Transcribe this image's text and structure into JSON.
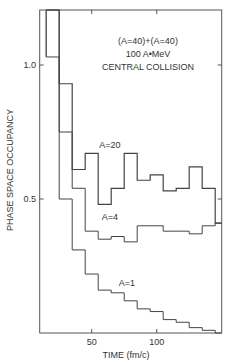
{
  "chart_data": {
    "type": "line",
    "style": "step histogram",
    "title_lines": [
      "(A=40)+(A=40)",
      "100 A•MeV",
      "CENTRAL COLLISION"
    ],
    "xlabel": "TIME (fm/c)",
    "ylabel": "PHASE SPACE OCCUPANCY",
    "xlim": [
      10,
      150
    ],
    "ylim": [
      0,
      1.2
    ],
    "x_ticks": [
      50,
      100
    ],
    "y_ticks": [
      {
        "value": 0.5,
        "label": "0.5"
      },
      {
        "value": 1.0,
        "label": "1.0"
      }
    ],
    "grid": false,
    "x_bin_centers": [
      20,
      30,
      40,
      50,
      60,
      70,
      80,
      90,
      100,
      110,
      120,
      130,
      140,
      150
    ],
    "series": [
      {
        "name": "A=20",
        "label": "A=20",
        "values": [
          1.3,
          0.93,
          0.61,
          0.67,
          0.48,
          0.54,
          0.67,
          0.57,
          0.59,
          0.53,
          0.54,
          0.62,
          0.54,
          0.41
        ]
      },
      {
        "name": "A=4",
        "label": "A=4",
        "values": [
          1.3,
          0.75,
          0.54,
          0.38,
          0.35,
          0.36,
          0.34,
          0.4,
          0.4,
          0.38,
          0.38,
          0.37,
          0.4,
          0.41
        ]
      },
      {
        "name": "A=1",
        "label": "A=1",
        "values": [
          1.03,
          0.5,
          0.31,
          0.22,
          0.16,
          0.15,
          0.12,
          0.09,
          0.08,
          0.05,
          0.04,
          0.02,
          0.01,
          0.0
        ]
      }
    ],
    "a1_first_bin_value": 1.3
  }
}
